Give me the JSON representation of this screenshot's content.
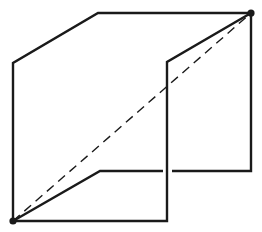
{
  "diagram": {
    "width": 262,
    "height": 232,
    "background": "#ffffff",
    "stroke_color": "#1a1a1a",
    "stroke_width": 2.4,
    "dash_width": 1.4,
    "dash_pattern": "9,6",
    "vertices": {
      "bottom_left": [
        13,
        221
      ],
      "top_right": [
        251,
        13
      ]
    },
    "solid_paths": [
      {
        "name": "outer-left-face",
        "points": [
          [
            13,
            221
          ],
          [
            13,
            63
          ],
          [
            98,
            13
          ],
          [
            251,
            13
          ]
        ]
      },
      {
        "name": "right-edge",
        "points": [
          [
            251,
            13
          ],
          [
            251,
            171
          ],
          [
            172,
            171
          ]
        ]
      },
      {
        "name": "middle-panel-top",
        "points": [
          [
            251,
            13
          ],
          [
            167,
            62
          ],
          [
            167,
            221
          ],
          [
            13,
            221
          ]
        ]
      },
      {
        "name": "lower-inner-edge",
        "points": [
          [
            13,
            221
          ],
          [
            100,
            171
          ],
          [
            163,
            171
          ]
        ]
      }
    ],
    "dashed_paths": [
      {
        "name": "hidden-diagonal",
        "points": [
          [
            13,
            221
          ],
          [
            251,
            13
          ]
        ]
      }
    ],
    "dots": [
      {
        "name": "vertex-bottom-left",
        "cx": 13,
        "cy": 221,
        "r": 3.6
      },
      {
        "name": "vertex-top-right",
        "cx": 251,
        "cy": 13,
        "r": 3.6
      }
    ]
  }
}
